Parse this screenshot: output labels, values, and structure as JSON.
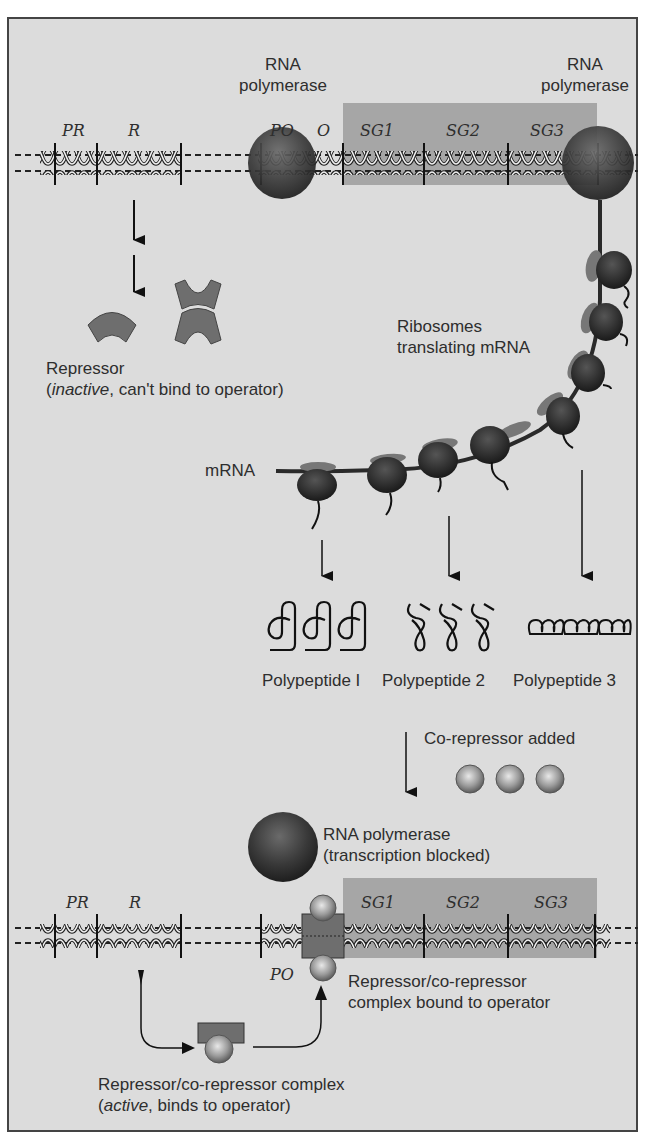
{
  "figure": {
    "colors": {
      "background": "#dcdcdc",
      "border": "#444444",
      "gene_block": "#a9a9a9",
      "polymerase": "#333333",
      "repressor": "#6e6e6e",
      "corepressor": "#9a9a9a"
    }
  },
  "top_operon": {
    "gene_labels": {
      "pr": "PR",
      "r": "R",
      "po": "PO",
      "o": "O",
      "sg1": "SG1",
      "sg2": "SG2",
      "sg3": "SG3"
    },
    "polymerase_left": {
      "line1": "RNA",
      "line2": "polymerase"
    },
    "polymerase_right": {
      "line1": "RNA",
      "line2": "polymerase"
    }
  },
  "repressor_inactive": {
    "line1": "Repressor",
    "line2_italic": "inactive",
    "line2_rest": ", can't bind to operator)",
    "line2_open": "("
  },
  "translation": {
    "ribosomes_label": {
      "line1": "Ribosomes",
      "line2": "translating mRNA"
    },
    "mrna_label": "mRNA"
  },
  "polypeptides": [
    {
      "label": "Polypeptide I"
    },
    {
      "label": "Polypeptide 2"
    },
    {
      "label": "Polypeptide 3"
    }
  ],
  "corepressor": {
    "label": "Co-repressor added",
    "count": 3
  },
  "blocked_polymerase": {
    "line1": "RNA polymerase",
    "line2": "(transcription blocked)"
  },
  "bottom_operon": {
    "gene_labels": {
      "pr": "PR",
      "r": "R",
      "po": "PO",
      "sg1": "SG1",
      "sg2": "SG2",
      "sg3": "SG3"
    },
    "bound_complex": {
      "line1": "Repressor/co-repressor",
      "line2": "complex bound to operator"
    }
  },
  "active_complex": {
    "line1": "Repressor/co-repressor complex",
    "line2_open": "(",
    "line2_italic": "active",
    "line2_rest": ", binds to operator)"
  }
}
